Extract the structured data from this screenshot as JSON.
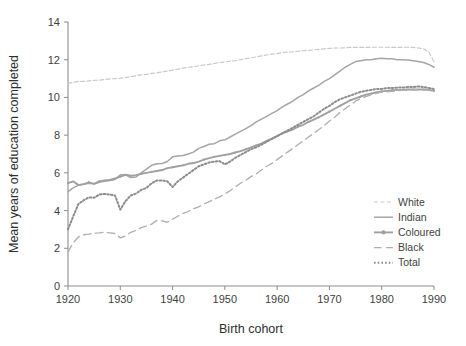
{
  "chart_data": {
    "type": "line",
    "title": "",
    "xlabel": "Birth cohort",
    "ylabel": "Mean years of education completed",
    "xlim": [
      1920,
      1990
    ],
    "ylim": [
      0,
      14
    ],
    "ytick_labels": [
      "0",
      "2",
      "4",
      "6",
      "8",
      "10",
      "12",
      "14"
    ],
    "ytick_values": [
      0,
      2,
      4,
      6,
      8,
      10,
      12,
      14
    ],
    "xtick_labels": [
      "1920",
      "1930",
      "1940",
      "1950",
      "1960",
      "1970",
      "1980",
      "1990"
    ],
    "xtick_values": [
      1920,
      1930,
      1940,
      1950,
      1960,
      1970,
      1980,
      1990
    ],
    "grid": false,
    "legend_position": "right-inside",
    "x": [
      1920,
      1921,
      1922,
      1923,
      1924,
      1925,
      1926,
      1927,
      1928,
      1929,
      1930,
      1931,
      1932,
      1933,
      1934,
      1935,
      1936,
      1937,
      1938,
      1939,
      1940,
      1941,
      1942,
      1943,
      1944,
      1945,
      1946,
      1947,
      1948,
      1949,
      1950,
      1951,
      1952,
      1953,
      1954,
      1955,
      1956,
      1957,
      1958,
      1959,
      1960,
      1961,
      1962,
      1963,
      1964,
      1965,
      1966,
      1967,
      1968,
      1969,
      1970,
      1971,
      1972,
      1973,
      1974,
      1975,
      1976,
      1977,
      1978,
      1979,
      1980,
      1981,
      1982,
      1983,
      1984,
      1985,
      1986,
      1987,
      1988,
      1989,
      1990
    ],
    "series": [
      {
        "name": "White",
        "color": "#c9c9c9",
        "style": "dashed-fine",
        "values": [
          10.75,
          10.8,
          10.85,
          10.85,
          10.88,
          10.9,
          10.92,
          10.95,
          10.98,
          11.0,
          11.02,
          11.05,
          11.1,
          11.15,
          11.2,
          11.22,
          11.28,
          11.3,
          11.35,
          11.4,
          11.45,
          11.5,
          11.55,
          11.6,
          11.62,
          11.68,
          11.72,
          11.75,
          11.8,
          11.85,
          11.88,
          11.92,
          11.95,
          12.0,
          12.05,
          12.1,
          12.15,
          12.2,
          12.25,
          12.3,
          12.32,
          12.38,
          12.4,
          12.42,
          12.45,
          12.48,
          12.5,
          12.52,
          12.55,
          12.58,
          12.6,
          12.62,
          12.62,
          12.63,
          12.65,
          12.65,
          12.65,
          12.65,
          12.66,
          12.66,
          12.66,
          12.66,
          12.65,
          12.65,
          12.66,
          12.66,
          12.65,
          12.62,
          12.58,
          12.4,
          11.9
        ]
      },
      {
        "name": "Indian",
        "color": "#a6a6a6",
        "style": "solid",
        "values": [
          5.0,
          5.2,
          5.35,
          5.4,
          5.45,
          5.42,
          5.5,
          5.55,
          5.6,
          5.65,
          5.9,
          5.9,
          5.75,
          5.78,
          6.0,
          6.2,
          6.4,
          6.48,
          6.5,
          6.6,
          6.85,
          6.9,
          6.92,
          7.0,
          7.1,
          7.3,
          7.4,
          7.52,
          7.55,
          7.7,
          7.75,
          7.9,
          8.05,
          8.2,
          8.35,
          8.5,
          8.7,
          8.85,
          9.0,
          9.15,
          9.3,
          9.5,
          9.65,
          9.8,
          10.0,
          10.15,
          10.35,
          10.5,
          10.65,
          10.85,
          11.0,
          11.2,
          11.4,
          11.6,
          11.75,
          11.9,
          11.95,
          12.0,
          12.0,
          12.05,
          12.08,
          12.05,
          12.05,
          12.0,
          12.0,
          11.98,
          11.95,
          11.9,
          11.85,
          11.75,
          11.6
        ]
      },
      {
        "name": "Coloured",
        "color": "#a0a0a0",
        "style": "solid-marker",
        "values": [
          5.45,
          5.55,
          5.35,
          5.4,
          5.5,
          5.42,
          5.55,
          5.6,
          5.62,
          5.7,
          5.8,
          5.9,
          5.85,
          5.88,
          5.95,
          6.0,
          6.05,
          6.1,
          6.15,
          6.25,
          6.3,
          6.35,
          6.4,
          6.48,
          6.52,
          6.6,
          6.7,
          6.78,
          6.85,
          6.9,
          6.95,
          7.0,
          7.08,
          7.15,
          7.25,
          7.35,
          7.45,
          7.55,
          7.7,
          7.82,
          7.95,
          8.1,
          8.2,
          8.3,
          8.45,
          8.55,
          8.7,
          8.82,
          8.95,
          9.1,
          9.25,
          9.4,
          9.55,
          9.7,
          9.85,
          9.95,
          10.05,
          10.15,
          10.2,
          10.28,
          10.32,
          10.35,
          10.38,
          10.4,
          10.4,
          10.42,
          10.42,
          10.42,
          10.42,
          10.4,
          10.35
        ]
      },
      {
        "name": "Black",
        "color": "#b0b0b0",
        "style": "dashed-long",
        "values": [
          1.8,
          2.3,
          2.6,
          2.72,
          2.75,
          2.8,
          2.82,
          2.85,
          2.82,
          2.78,
          2.55,
          2.65,
          2.85,
          2.95,
          3.1,
          3.18,
          3.28,
          3.48,
          3.45,
          3.38,
          3.55,
          3.7,
          3.85,
          3.95,
          4.1,
          4.2,
          4.35,
          4.48,
          4.6,
          4.72,
          4.88,
          5.05,
          5.25,
          5.45,
          5.6,
          5.8,
          5.95,
          6.15,
          6.35,
          6.5,
          6.7,
          6.9,
          7.1,
          7.3,
          7.5,
          7.7,
          7.9,
          8.1,
          8.3,
          8.5,
          8.75,
          8.95,
          9.2,
          9.4,
          9.6,
          9.8,
          9.95,
          10.05,
          10.15,
          10.22,
          10.28,
          10.3,
          10.32,
          10.35,
          10.38,
          10.38,
          10.4,
          10.4,
          10.4,
          10.38,
          10.32
        ]
      },
      {
        "name": "Total",
        "color": "#8c8c8c",
        "style": "dotted",
        "values": [
          3.0,
          3.7,
          4.35,
          4.55,
          4.7,
          4.68,
          4.85,
          4.88,
          4.85,
          4.8,
          4.05,
          4.5,
          4.8,
          4.9,
          5.1,
          5.2,
          5.45,
          5.6,
          5.6,
          5.55,
          5.25,
          5.55,
          5.75,
          5.95,
          6.15,
          6.35,
          6.45,
          6.55,
          6.6,
          6.62,
          6.45,
          6.6,
          6.8,
          6.95,
          7.1,
          7.25,
          7.35,
          7.5,
          7.65,
          7.8,
          7.95,
          8.1,
          8.25,
          8.4,
          8.55,
          8.7,
          8.85,
          9.0,
          9.2,
          9.4,
          9.55,
          9.75,
          9.9,
          10.0,
          10.1,
          10.2,
          10.3,
          10.35,
          10.4,
          10.45,
          10.45,
          10.5,
          10.5,
          10.52,
          10.52,
          10.55,
          10.55,
          10.58,
          10.55,
          10.5,
          10.45
        ]
      }
    ]
  },
  "legend": {
    "items": [
      {
        "label": "White"
      },
      {
        "label": "Indian"
      },
      {
        "label": "Coloured"
      },
      {
        "label": "Black"
      },
      {
        "label": "Total"
      }
    ]
  },
  "axes": {
    "x_title": "Birth cohort",
    "y_title": "Mean years of education completed"
  }
}
